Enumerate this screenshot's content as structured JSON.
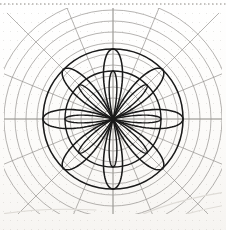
{
  "document": {
    "kind": "scanned-drawing",
    "title": "Polar rose on polar graph paper",
    "background_color": "#fdfdfc",
    "width": 226,
    "height": 230
  },
  "artifacts": {
    "top_edge_dotted_line": {
      "label": "scanned page top edge",
      "color": "#b2b0ac",
      "y": 4,
      "dash": "1.5 2.5"
    },
    "smudges": {
      "label": "faint curved scan smudges",
      "color": "#dedbd6",
      "paths": [
        "M 112 229 C 140 214, 172 200, 226 192",
        "M 148 230 C 168 219, 196 210, 226 205",
        "M 170 230 C 190 223, 210 217, 226 214",
        "M 2 214 C 26 210, 58 208, 96 210"
      ]
    }
  },
  "polar_grid": {
    "label": "polar graph paper grid",
    "center": {
      "x": 113,
      "y": 119
    },
    "line_color": "#8c8a86",
    "line_width": 0.65,
    "axis_color": "#a5a3a0",
    "axis_width": 0.8,
    "spoke_count": 16,
    "spoke_angles_deg": [
      0,
      22.5,
      45,
      67.5,
      90,
      112.5,
      135,
      157.5,
      180,
      202.5,
      225,
      247.5,
      270,
      292.5,
      315,
      337.5
    ],
    "spoke_inner_radius": 10,
    "spoke_outer_radius": 150,
    "ring_count": 11,
    "ring_radii": [
      10,
      21,
      32,
      43,
      54,
      65,
      76,
      87,
      98,
      109,
      120
    ],
    "clip": {
      "x": 4,
      "y": 8,
      "width": 218,
      "height": 206
    }
  },
  "rose_curve": {
    "label": "rose / rhodonea curve figure",
    "stroke_color": "#1a1a1a",
    "stroke_width": 1.55,
    "center": {
      "x": 113,
      "y": 119
    },
    "petal_count": 8,
    "petal_max_radius": 70,
    "petal_half_width_deg": 22,
    "inner_petal_count": 8,
    "inner_petal_max_radius": 48,
    "inner_petal_half_width_deg": 13,
    "bounding_circle_radius": 70,
    "inner_circle_radius": 48,
    "equation": "r = a * cos(k * theta)"
  },
  "chart_data": {
    "type": "line",
    "coordinate_system": "polar",
    "xlabel": "",
    "ylabel": "",
    "grid": true,
    "legend": "none",
    "theta_range_deg": [
      0,
      360
    ],
    "r_range": [
      0,
      120
    ],
    "r_tick_values": [
      10,
      21,
      32,
      43,
      54,
      65,
      76,
      87,
      98,
      109,
      120
    ],
    "theta_tick_values_deg": [
      0,
      22.5,
      45,
      67.5,
      90,
      112.5,
      135,
      157.5,
      180,
      202.5,
      225,
      247.5,
      270,
      292.5,
      315,
      337.5
    ],
    "series": [
      {
        "name": "outer rose (8 petals)",
        "equation": "r = 70 * cos(4*theta)",
        "amplitude": 70,
        "k": 4,
        "color": "#1a1a1a"
      },
      {
        "name": "inner rose (8 narrow petals)",
        "equation": "r = 48 * cos(4*theta)",
        "amplitude": 48,
        "k": 4,
        "color": "#1a1a1a"
      },
      {
        "name": "bounding circle",
        "equation": "r = 70",
        "amplitude": 70,
        "color": "#1a1a1a"
      },
      {
        "name": "inner circle",
        "equation": "r = 48",
        "amplitude": 48,
        "color": "#1a1a1a"
      }
    ]
  }
}
